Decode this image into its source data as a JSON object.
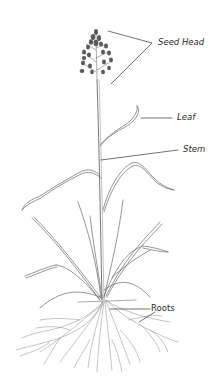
{
  "diagram": {
    "labels": [
      {
        "id": "seed-head",
        "text": "Seed Head"
      },
      {
        "id": "leaf",
        "text": "Leaf"
      },
      {
        "id": "stem",
        "text": "Stem"
      },
      {
        "id": "roots",
        "text": "Roots"
      }
    ],
    "colors": {
      "line": "#555555",
      "seed": "#5a5a5a",
      "background": "#ffffff"
    }
  }
}
